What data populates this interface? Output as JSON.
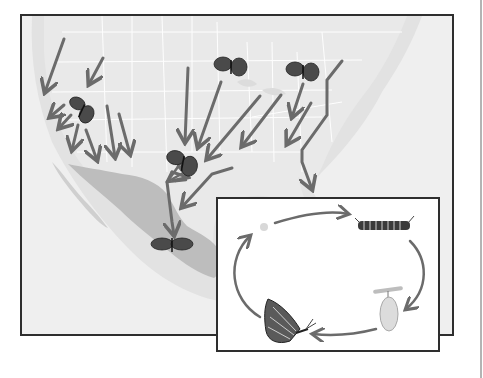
{
  "figure": {
    "map": {
      "region": "North America",
      "colors": {
        "ocean": "#eeeeee",
        "land": "#e4e4e4",
        "state_lines": "#ffffff",
        "mexico_highlight": "#bcbcbc",
        "coast_shelf": "#d9d9d9",
        "arrow": "#6b6b6b",
        "frame": "#2e2e2e"
      },
      "butterflies": [
        {
          "id": "west",
          "x": 80,
          "y": 108
        },
        {
          "id": "great-lakes",
          "x": 229,
          "y": 64
        },
        {
          "id": "northeast",
          "x": 301,
          "y": 69
        },
        {
          "id": "texas",
          "x": 181,
          "y": 160
        },
        {
          "id": "mexico-overwintering",
          "x": 170,
          "y": 242
        }
      ],
      "arrow_count": 18
    },
    "lifecycle_inset": {
      "stages": [
        "egg",
        "caterpillar",
        "chrysalis",
        "adult butterfly"
      ],
      "direction": "clockwise",
      "colors": {
        "background": "#ffffff",
        "arrow": "#6b6b6b",
        "frame": "#2e2e2e"
      }
    }
  }
}
